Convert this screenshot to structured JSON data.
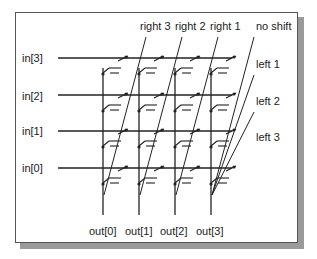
{
  "diagram": {
    "inputs": [
      "in[3]",
      "in[2]",
      "in[1]",
      "in[0]"
    ],
    "outputs": [
      "out[0]",
      "out[1]",
      "out[2]",
      "out[3]"
    ],
    "shift_controls_top": [
      "right 3",
      "right 2",
      "right 1",
      "no shift"
    ],
    "shift_controls_right": [
      "left 1",
      "left 2",
      "left 3"
    ],
    "colors": {
      "line": "#222222",
      "frame": "#555555",
      "shadow": "#9a9a9a",
      "background": "#ffffff"
    }
  }
}
